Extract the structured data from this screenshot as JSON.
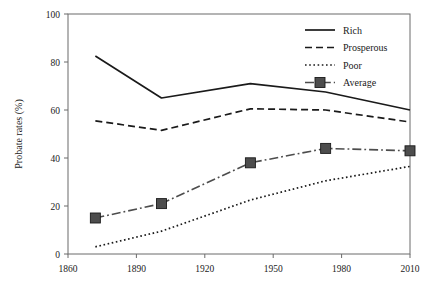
{
  "chart_data": {
    "type": "line",
    "title": "",
    "xlabel": "",
    "ylabel": "Probate rates (%)",
    "xlim": [
      1860,
      2010
    ],
    "ylim": [
      0,
      100
    ],
    "xticks": [
      1860,
      1890,
      1920,
      1950,
      1980,
      2010
    ],
    "yticks": [
      0,
      20,
      40,
      60,
      80,
      100
    ],
    "xtick_labels": [
      "1860",
      "1890",
      "1920",
      "1950",
      "1980",
      "2010"
    ],
    "ytick_labels": [
      "0",
      "20",
      "40",
      "60",
      "80",
      "100"
    ],
    "grid": false,
    "legend_position": "top-right",
    "series": [
      {
        "name": "Rich",
        "style": "solid",
        "marker": "none",
        "color": "#1a1a1a",
        "x": [
          1872,
          1901,
          1940,
          1973,
          2010
        ],
        "values": [
          82.5,
          65.0,
          71.0,
          67.5,
          60.0
        ]
      },
      {
        "name": "Prosperous",
        "style": "dashed",
        "marker": "none",
        "color": "#1a1a1a",
        "x": [
          1872,
          1901,
          1940,
          1973,
          2010
        ],
        "values": [
          55.5,
          51.5,
          60.5,
          60.0,
          55.0
        ]
      },
      {
        "name": "Poor",
        "style": "dotted",
        "marker": "none",
        "color": "#1a1a1a",
        "x": [
          1872,
          1901,
          1940,
          1973,
          2010
        ],
        "values": [
          3.0,
          9.5,
          22.5,
          30.5,
          36.5
        ]
      },
      {
        "name": "Average",
        "style": "dash-dot",
        "marker": "square",
        "color": "#4d4d4d",
        "x": [
          1872,
          1901,
          1940,
          1973,
          2010
        ],
        "values": [
          15.0,
          21.0,
          38.0,
          44.0,
          43.0
        ]
      }
    ],
    "legend_entries": [
      "Rich",
      "Prosperous",
      "Poor",
      "Average"
    ]
  },
  "axis": {
    "y_title": "Probate rates (%)"
  },
  "legend": {
    "rich": "Rich",
    "prosperous": "Prosperous",
    "poor": "Poor",
    "average": "Average"
  }
}
